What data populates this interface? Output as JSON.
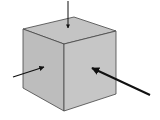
{
  "diagram": {
    "title": "",
    "colors": {
      "background": "#ffffff",
      "face_top": "#c4c4c4",
      "face_left": "#bdbdbd",
      "face_right": "#c6c6c6",
      "edge": "#444444",
      "arrow": "#111111"
    },
    "cube": {
      "vertices": {
        "top_left": [
          23,
          29
        ],
        "top_back": [
          74,
          17
        ],
        "top_right": [
          116,
          31
        ],
        "front_top": [
          64,
          44
        ],
        "bottom_left": [
          23,
          88
        ],
        "bottom_front": [
          64,
          111
        ],
        "bottom_right": [
          116,
          94
        ]
      }
    },
    "arrows": [
      {
        "name": "top-arrow",
        "from": [
          68,
          1
        ],
        "to": [
          68,
          28
        ],
        "width": 1
      },
      {
        "name": "left-arrow",
        "from": [
          13,
          77
        ],
        "to": [
          44,
          67
        ],
        "width": 1.3
      },
      {
        "name": "right-arrow",
        "from": [
          150,
          95
        ],
        "to": [
          92,
          68
        ],
        "width": 2
      }
    ]
  }
}
